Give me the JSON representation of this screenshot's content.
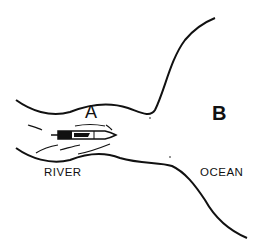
{
  "diagram": {
    "labels": {
      "point_a": "A",
      "point_b": "B",
      "river": "RIVER",
      "ocean": "OCEAN"
    },
    "colors": {
      "ink": "#111111",
      "background": "#ffffff"
    }
  }
}
